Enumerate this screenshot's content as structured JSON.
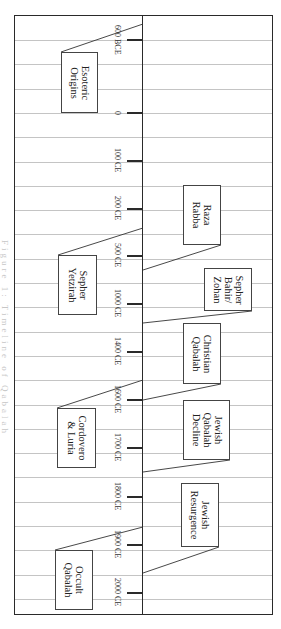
{
  "diagram": {
    "type": "timeline",
    "orientation": "rotated-90",
    "caption": "Figure 1: Timeline of Qabalah",
    "colors": {
      "frame": "#2a2a2a",
      "grid": "#c4c4c4",
      "box_border": "#444444",
      "text": "#222222"
    },
    "axis_ticks": [
      {
        "label": "600 BCE",
        "y": 40
      },
      {
        "label": "0",
        "y": 113
      },
      {
        "label": "100 CE",
        "y": 161
      },
      {
        "label": "200 CE",
        "y": 209
      },
      {
        "label": "500 CE",
        "y": 256
      },
      {
        "label": "1000 CE",
        "y": 304
      },
      {
        "label": "1400 CE",
        "y": 352
      },
      {
        "label": "1600 CE",
        "y": 400
      },
      {
        "label": "1700 CE",
        "y": 448
      },
      {
        "label": "1800 CE",
        "y": 497
      },
      {
        "label": "1900 CE",
        "y": 545
      },
      {
        "label": "2000 CE",
        "y": 593
      }
    ],
    "left_events": [
      {
        "label": "Esoteric\nOrigins",
        "box": [
          61,
          52,
          37,
          61
        ],
        "line": [
          61,
          52,
          143,
          24
        ]
      },
      {
        "label": "Sepher\nYetzirah",
        "box": [
          58,
          255,
          39,
          60
        ],
        "line": [
          58,
          255,
          143,
          228
        ]
      },
      {
        "label": "Cordovero\n& Luria",
        "box": [
          57,
          408,
          39,
          60
        ],
        "line": [
          57,
          408,
          143,
          380
        ]
      },
      {
        "label": "Occult\nQabalah",
        "box": [
          55,
          550,
          38,
          60
        ],
        "line": [
          55,
          550,
          143,
          527
        ]
      }
    ],
    "right_events": [
      {
        "label": "Raza\nRabba",
        "box": [
          183,
          185,
          38,
          60
        ],
        "line": [
          221,
          245,
          143,
          270
        ]
      },
      {
        "label": "Sepher\nBahir/\nZohan",
        "box": [
          204,
          268,
          48,
          43
        ],
        "line": [
          252,
          311,
          143,
          323
        ]
      },
      {
        "label": "Christian\nQabalah",
        "box": [
          183,
          323,
          38,
          61
        ],
        "line": [
          221,
          384,
          143,
          400
        ]
      },
      {
        "label": "Jewish\nQabalah\nDecline",
        "box": [
          183,
          400,
          47,
          60
        ],
        "line": [
          230,
          460,
          143,
          472
        ]
      },
      {
        "label": "Jewish\nResurgence",
        "box": [
          181,
          483,
          38,
          64
        ],
        "line": [
          219,
          547,
          143,
          573
        ]
      }
    ]
  }
}
